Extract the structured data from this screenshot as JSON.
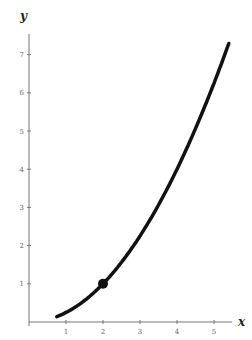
{
  "chart_data": {
    "type": "line",
    "title": "",
    "xlabel": "x",
    "ylabel": "y",
    "xlim": [
      0,
      5.6
    ],
    "ylim": [
      0,
      7.6
    ],
    "x_ticks": [
      "1",
      "2",
      "3",
      "4",
      "5"
    ],
    "y_ticks": [
      "1",
      "2",
      "3",
      "4",
      "5",
      "6",
      "7"
    ],
    "grid": false,
    "series": [
      {
        "name": "y = x^2/4",
        "x": [
          0.75,
          1,
          1.5,
          2,
          2.5,
          3,
          3.5,
          4,
          4.5,
          5,
          5.4
        ],
        "y": [
          0.14,
          0.25,
          0.56,
          1,
          1.56,
          2.25,
          3.06,
          4,
          5.06,
          6.25,
          7.29
        ]
      }
    ],
    "highlighted_point": {
      "x": 2,
      "y": 1
    }
  }
}
